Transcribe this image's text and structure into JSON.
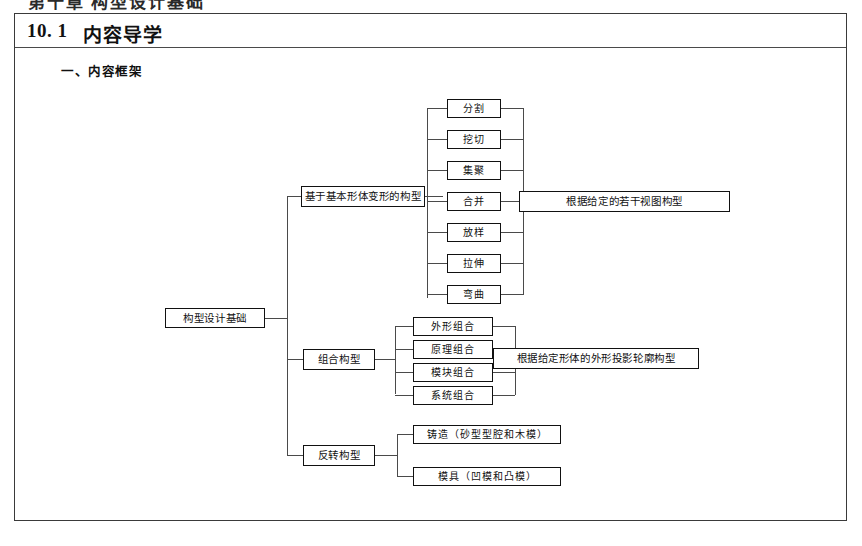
{
  "top_sliver": {
    "text": "第十章   构型设计基础"
  },
  "header": {
    "section_number": "10. 1",
    "section_title": "内容导学"
  },
  "sub_heading": "一、内容框架",
  "diagram": {
    "root": {
      "label": "构型设计基础"
    },
    "branches": [
      {
        "label": "基于基本形体变形的构型",
        "children": [
          "分割",
          "挖切",
          "集聚",
          "合并",
          "放样",
          "拉伸",
          "弯曲"
        ],
        "result": "根据给定的若干视图构型"
      },
      {
        "label": "组合构型",
        "children": [
          "外形组合",
          "原理组合",
          "模块组合",
          "系统组合"
        ],
        "result": "根据给定形体的外形投影轮廓构型"
      },
      {
        "label": "反转构型",
        "children": [
          "铸造（砂型型腔和木模）",
          "模具（凹模和凸模）"
        ],
        "result": ""
      }
    ]
  },
  "colors": {
    "frame_border": "#3a3a3a",
    "node_border": "#111111",
    "connector": "#4a4a4a",
    "page_background": "#ffffff"
  }
}
